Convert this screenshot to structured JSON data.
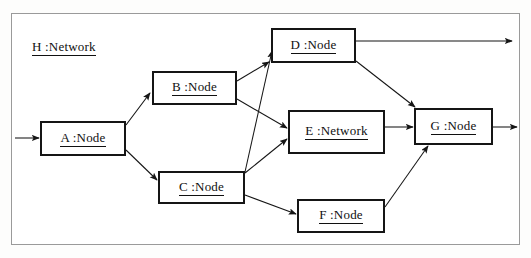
{
  "diagram": {
    "title": "H :Network",
    "container_label": "H :Network",
    "frame": {
      "x": 11,
      "y": 13,
      "width": 509,
      "height": 232,
      "border_color": "#9a9a9a"
    },
    "stroke_color": "#151515",
    "background": "#ffffff",
    "nodes": [
      {
        "id": "A",
        "label": "A :Node",
        "stereotype": "Node",
        "x": 40,
        "y": 121,
        "width": 86,
        "height": 35
      },
      {
        "id": "B",
        "label": "B :Node",
        "stereotype": "Node",
        "x": 152,
        "y": 71,
        "width": 85,
        "height": 34
      },
      {
        "id": "C",
        "label": "C :Node",
        "stereotype": "Node",
        "x": 158,
        "y": 171,
        "width": 87,
        "height": 33
      },
      {
        "id": "D",
        "label": "D :Node",
        "stereotype": "Node",
        "x": 271,
        "y": 28,
        "width": 85,
        "height": 35
      },
      {
        "id": "E",
        "label": "E :Network",
        "stereotype": "Network",
        "x": 288,
        "y": 110,
        "width": 97,
        "height": 44
      },
      {
        "id": "F",
        "label": "F :Node",
        "stereotype": "Node",
        "x": 297,
        "y": 199,
        "width": 88,
        "height": 34
      },
      {
        "id": "G",
        "label": "G :Node",
        "stereotype": "Node",
        "x": 414,
        "y": 108,
        "width": 79,
        "height": 37
      }
    ],
    "edges": [
      {
        "from": "external-left",
        "to": "A",
        "x1": 15,
        "y1": 138,
        "x2": 39,
        "y2": 138
      },
      {
        "from": "A",
        "to": "B",
        "x1": 126,
        "y1": 125,
        "x2": 150,
        "y2": 93
      },
      {
        "from": "A",
        "to": "C",
        "x1": 126,
        "y1": 150,
        "x2": 157,
        "y2": 180
      },
      {
        "from": "B",
        "to": "D",
        "x1": 237,
        "y1": 81,
        "x2": 269,
        "y2": 62
      },
      {
        "from": "B",
        "to": "E",
        "x1": 237,
        "y1": 99,
        "x2": 287,
        "y2": 128
      },
      {
        "from": "C",
        "to": "D",
        "x1": 245,
        "y1": 172,
        "x2": 272,
        "y2": 51
      },
      {
        "from": "C",
        "to": "E",
        "x1": 245,
        "y1": 173,
        "x2": 287,
        "y2": 139
      },
      {
        "from": "C",
        "to": "F",
        "x1": 245,
        "y1": 195,
        "x2": 296,
        "y2": 214
      },
      {
        "from": "D",
        "to": "external-right",
        "x1": 356,
        "y1": 41,
        "x2": 512,
        "y2": 41
      },
      {
        "from": "D",
        "to": "G",
        "x1": 356,
        "y1": 61,
        "x2": 415,
        "y2": 107
      },
      {
        "from": "E",
        "to": "G",
        "x1": 385,
        "y1": 127,
        "x2": 413,
        "y2": 127
      },
      {
        "from": "F",
        "to": "G",
        "x1": 385,
        "y1": 207,
        "x2": 428,
        "y2": 146
      },
      {
        "from": "G",
        "to": "external-right",
        "x1": 493,
        "y1": 127,
        "x2": 517,
        "y2": 127
      }
    ]
  }
}
